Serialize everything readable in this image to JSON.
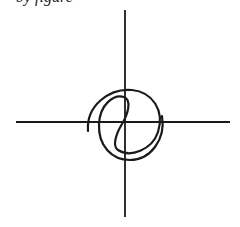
{
  "header": {
    "clipped_text": "by figure"
  },
  "diagram": {
    "stroke_color": "#1a1a1a",
    "axes": {
      "horizontal": {
        "x1": 16,
        "y1": 122,
        "x2": 230,
        "y2": 122
      },
      "vertical": {
        "x1": 125,
        "y1": 10,
        "x2": 125,
        "y2": 217
      }
    },
    "curve_description": "spiral curve looping around the origin"
  }
}
